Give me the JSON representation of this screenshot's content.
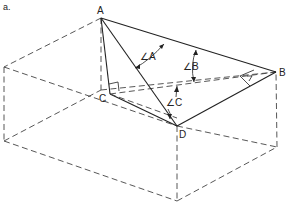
{
  "figure": {
    "panel_label": "a.",
    "vertices": {
      "A": {
        "label": "A",
        "x": 101,
        "y": 18
      },
      "B": {
        "label": "B",
        "x": 276,
        "y": 72
      },
      "C": {
        "label": "C",
        "x": 110,
        "y": 94
      },
      "D": {
        "label": "D",
        "x": 177,
        "y": 126
      }
    },
    "angle_labels": {
      "angle_a": "∠A",
      "angle_b": "∠B",
      "angle_c": "∠C"
    },
    "box_corners": {
      "top_left": [
        4,
        67
      ],
      "bottom_left": [
        4,
        141
      ],
      "bottom_front": [
        177,
        201
      ],
      "bottom_right": [
        277,
        147
      ]
    },
    "colors": {
      "line": "#222222",
      "dash": "#444444",
      "background": "#ffffff"
    }
  }
}
